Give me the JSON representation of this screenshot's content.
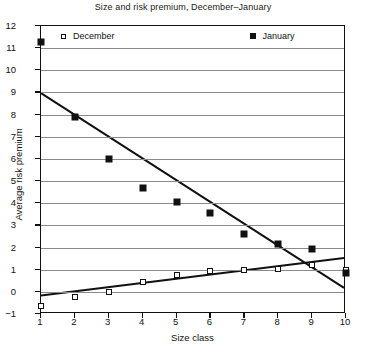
{
  "chart_data": {
    "type": "scatter",
    "title": "Size and risk premium, December–January",
    "xlabel": "Size class",
    "ylabel": "Average risk premium",
    "x": [
      1,
      2,
      3,
      4,
      5,
      6,
      7,
      8,
      9,
      10
    ],
    "xlim": [
      1,
      10
    ],
    "ylim": [
      -1,
      12
    ],
    "xticks": [
      "1",
      "2",
      "3",
      "4",
      "5",
      "6",
      "7",
      "8",
      "9",
      "10"
    ],
    "yticks": [
      "12",
      "11",
      "10",
      "9",
      "8",
      "7",
      "6",
      "5",
      "4",
      "3",
      "2",
      "1",
      "0",
      "-1"
    ],
    "grid": "horizontal",
    "legend_position": "top-inside",
    "series": [
      {
        "name": "December",
        "marker": "open-square",
        "values": [
          -0.65,
          -0.25,
          0.0,
          0.45,
          0.75,
          0.95,
          1.0,
          1.05,
          1.2,
          1.0
        ],
        "trendline": {
          "x": [
            1,
            10
          ],
          "y": [
            -0.25,
            1.45
          ]
        }
      },
      {
        "name": "January",
        "marker": "filled-square",
        "values": [
          11.3,
          7.9,
          6.0,
          4.7,
          4.05,
          3.55,
          2.6,
          2.15,
          1.95,
          0.85
        ],
        "trendline": {
          "x": [
            1,
            10
          ],
          "y": [
            8.95,
            0.1
          ]
        }
      }
    ],
    "colors": {
      "axis": "#111111",
      "grid": "#8a8a8a",
      "marker": "#111111",
      "background": "#ffffff"
    }
  }
}
